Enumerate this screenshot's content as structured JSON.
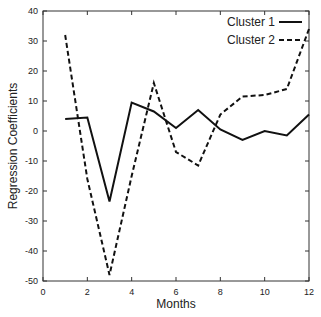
{
  "chart_data": {
    "type": "line",
    "title": "",
    "xlabel": "Months",
    "ylabel": "Regression Coefficients",
    "xlim": [
      0,
      12
    ],
    "ylim": [
      -50,
      40
    ],
    "xticks": [
      0,
      2,
      4,
      6,
      8,
      10,
      12
    ],
    "yticks": [
      -50,
      -40,
      -30,
      -20,
      -10,
      0,
      10,
      20,
      30,
      40
    ],
    "grid": false,
    "legend_position": "upper right",
    "x": [
      1,
      2,
      3,
      4,
      5,
      6,
      7,
      8,
      9,
      10,
      11,
      12
    ],
    "series": [
      {
        "name": "Cluster 1",
        "style": "solid",
        "values": [
          4,
          4.5,
          -23.5,
          9.5,
          6.5,
          1,
          7,
          0.5,
          -3,
          0,
          -1.5,
          5.5
        ]
      },
      {
        "name": "Cluster 2",
        "style": "dashed",
        "values": [
          32,
          -16,
          -48,
          -15,
          16,
          -7,
          -11.5,
          5.5,
          11.5,
          12,
          14,
          34
        ]
      }
    ]
  },
  "colors": {
    "line": "#111111",
    "axis": "#333333"
  }
}
